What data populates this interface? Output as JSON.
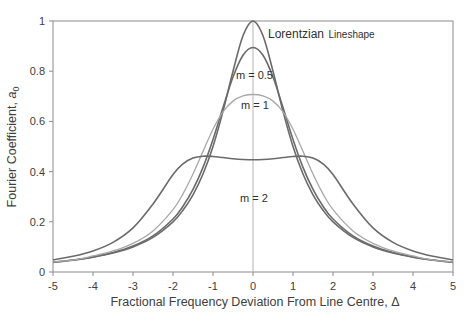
{
  "chart_data": {
    "type": "line",
    "title": "",
    "xlabel": "Fractional Frequency Deviation From Line Centre, Δ",
    "ylabel_prefix": "Fourier Coefficient, ",
    "ylabel_symbol": "a",
    "ylabel_subscript": "0",
    "xlim": [
      -5,
      5
    ],
    "ylim": [
      0,
      1
    ],
    "x_ticks": [
      -5,
      -4,
      -3,
      -2,
      -1,
      0,
      1,
      2,
      3,
      4,
      5
    ],
    "x_tick_labels": [
      "-5",
      "-4",
      "-3",
      "-2",
      "-1",
      "0",
      "1",
      "2",
      "3",
      "4",
      "5"
    ],
    "y_ticks": [
      0,
      0.2,
      0.4,
      0.6,
      0.8,
      1
    ],
    "y_tick_labels": [
      "0",
      "0.2",
      "0.4",
      "0.6",
      "0.8",
      "1"
    ],
    "grid": false,
    "legend": "none (inline annotations)",
    "center_line_x": 0,
    "x_half": [
      0,
      0.25,
      0.5,
      0.75,
      1,
      1.25,
      1.5,
      1.75,
      2,
      2.5,
      3,
      3.5,
      4,
      4.5,
      5
    ],
    "symmetric_about_zero": true,
    "series": [
      {
        "name": "Lorentzian Lineshape",
        "m": 0,
        "color": "#6b6b6b",
        "values_half": [
          1.0,
          0.9412,
          0.8,
          0.64,
          0.5,
          0.3902,
          0.3077,
          0.2462,
          0.2,
          0.1379,
          0.1,
          0.0755,
          0.0588,
          0.0471,
          0.0385
        ]
      },
      {
        "name": "m = 0.5",
        "m": 0.5,
        "color": "#6b6b6b",
        "values_half": [
          0.8944,
          0.8636,
          0.7769,
          0.6552,
          0.5281,
          0.4169,
          0.3288,
          0.2618,
          0.2113,
          0.1439,
          0.1033,
          0.0774,
          0.06,
          0.0478,
          0.039
        ]
      },
      {
        "name": "m = 1",
        "m": 1,
        "color": "#a8a8a8",
        "values_half": [
          0.7071,
          0.7013,
          0.6808,
          0.6381,
          0.5689,
          0.4806,
          0.3903,
          0.3114,
          0.2486,
          0.1638,
          0.1143,
          0.0838,
          0.0639,
          0.0471,
          0.0407
        ]
      },
      {
        "name": "m = 2",
        "m": 2,
        "color": "#6b6b6b",
        "values_half": [
          0.4472,
          0.4483,
          0.4514,
          0.4559,
          0.4602,
          0.4613,
          0.4537,
          0.4307,
          0.3882,
          0.2711,
          0.1757,
          0.118,
          0.0838,
          0.0626,
          0.0486
        ]
      }
    ],
    "annotations": [
      {
        "text_main": "Lorentzian",
        "text_small": "Lineshape",
        "x": 268,
        "y": 38
      },
      {
        "text": "m = 0.5",
        "x": 236,
        "y": 79
      },
      {
        "text": "m = 1",
        "x": 241,
        "y": 109
      },
      {
        "text": "m = 2",
        "x": 240,
        "y": 202
      }
    ]
  },
  "layout": {
    "plot_left": 53,
    "plot_right": 453,
    "plot_top": 21,
    "plot_bottom": 272,
    "axis_color": "#8c8c8c",
    "center_line_color": "#b5b5b5"
  }
}
